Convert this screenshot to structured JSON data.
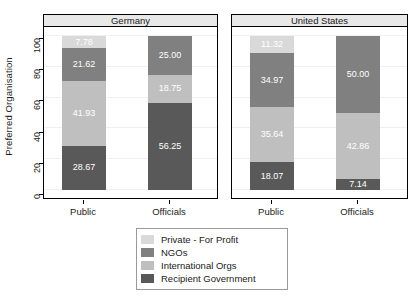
{
  "chart_data": {
    "type": "bar",
    "stacked": true,
    "title": "",
    "subtitle": "",
    "xlabel": "",
    "ylabel": "Preferred Organisation",
    "ylim": [
      0,
      100
    ],
    "yticks": [
      0,
      20,
      40,
      60,
      80,
      100
    ],
    "grid": true,
    "legend_position": "bottom",
    "panels": [
      "Germany",
      "United States"
    ],
    "categories": [
      "Public",
      "Officials"
    ],
    "series": [
      {
        "name": "Private - For Profit",
        "color": "#d9d9d9",
        "values": {
          "Germany": [
            7.78,
            null
          ],
          "United States": [
            11.32,
            null
          ]
        },
        "labels": {
          "Germany": [
            "7.78",
            ""
          ],
          "United States": [
            "11.32",
            ""
          ]
        }
      },
      {
        "name": "NGOs",
        "color": "#808080",
        "values": {
          "Germany": [
            21.62,
            25.0
          ],
          "United States": [
            34.97,
            50.0
          ]
        },
        "labels": {
          "Germany": [
            "21.62",
            "25.00"
          ],
          "United States": [
            "34.97",
            "50.00"
          ]
        }
      },
      {
        "name": "International Orgs",
        "color": "#bfbfbf",
        "values": {
          "Germany": [
            41.93,
            18.75
          ],
          "United States": [
            35.64,
            42.86
          ]
        },
        "labels": {
          "Germany": [
            "41.93",
            "18.75"
          ],
          "United States": [
            "35.64",
            "42.86"
          ]
        }
      },
      {
        "name": "Recipient Government",
        "color": "#595959",
        "values": {
          "Germany": [
            28.67,
            56.25
          ],
          "United States": [
            18.07,
            7.14
          ]
        },
        "labels": {
          "Germany": [
            "28.67",
            "56.25"
          ],
          "United States": [
            "18.07",
            "7.14"
          ]
        }
      }
    ]
  },
  "axis": {
    "y_title": "Preferred Organisation",
    "y_ticks": [
      "0",
      "20",
      "40",
      "60",
      "80",
      "100"
    ],
    "x_ticks": [
      "Public",
      "Officials"
    ]
  },
  "panels": [
    {
      "title": "Germany",
      "bars": [
        {
          "category": "Public",
          "segments": [
            {
              "series": "Private - For Profit",
              "value": 7.78,
              "label": "7.78",
              "color": "#d9d9d9"
            },
            {
              "series": "NGOs",
              "value": 21.62,
              "label": "21.62",
              "color": "#808080"
            },
            {
              "series": "International Orgs",
              "value": 41.93,
              "label": "41.93",
              "color": "#bfbfbf"
            },
            {
              "series": "Recipient Government",
              "value": 28.67,
              "label": "28.67",
              "color": "#595959"
            }
          ]
        },
        {
          "category": "Officials",
          "segments": [
            {
              "series": "NGOs",
              "value": 25.0,
              "label": "25.00",
              "color": "#808080"
            },
            {
              "series": "International Orgs",
              "value": 18.75,
              "label": "18.75",
              "color": "#bfbfbf"
            },
            {
              "series": "Recipient Government",
              "value": 56.25,
              "label": "56.25",
              "color": "#595959"
            }
          ]
        }
      ]
    },
    {
      "title": "United States",
      "bars": [
        {
          "category": "Public",
          "segments": [
            {
              "series": "Private - For Profit",
              "value": 11.32,
              "label": "11.32",
              "color": "#d9d9d9"
            },
            {
              "series": "NGOs",
              "value": 34.97,
              "label": "34.97",
              "color": "#808080"
            },
            {
              "series": "International Orgs",
              "value": 35.64,
              "label": "35.64",
              "color": "#bfbfbf"
            },
            {
              "series": "Recipient Government",
              "value": 18.07,
              "label": "18.07",
              "color": "#595959"
            }
          ]
        },
        {
          "category": "Officials",
          "segments": [
            {
              "series": "NGOs",
              "value": 50.0,
              "label": "50.00",
              "color": "#808080"
            },
            {
              "series": "International Orgs",
              "value": 42.86,
              "label": "42.86",
              "color": "#bfbfbf"
            },
            {
              "series": "Recipient Government",
              "value": 7.14,
              "label": "7.14",
              "color": "#595959"
            }
          ]
        }
      ]
    }
  ],
  "legend": {
    "items": [
      {
        "label": "Private - For Profit",
        "color": "#d9d9d9"
      },
      {
        "label": "NGOs",
        "color": "#808080"
      },
      {
        "label": "International Orgs",
        "color": "#bfbfbf"
      },
      {
        "label": "Recipient Government",
        "color": "#595959"
      }
    ]
  }
}
